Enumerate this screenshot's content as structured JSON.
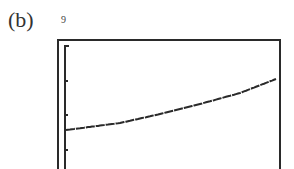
{
  "panel": {
    "label": "(b)"
  },
  "axes": {
    "ymax_label": "9"
  },
  "chart_data": {
    "type": "line",
    "title": "",
    "xlabel": "",
    "ylabel": "",
    "ylim": [
      0,
      9
    ],
    "y_tick_label_top": "9",
    "grid": false,
    "legend": null,
    "style": "graphing-calculator stepped pixel curve, increasing, slightly concave up",
    "x_pixels": [
      66,
      120,
      160,
      200,
      240,
      276
    ],
    "y_pixels": [
      130,
      123,
      114,
      104,
      93,
      79
    ],
    "approx_values": {
      "x_norm": [
        0.0,
        0.26,
        0.45,
        0.64,
        0.83,
        1.0
      ],
      "y": [
        2.7,
        3.3,
        4.1,
        4.9,
        5.9,
        7.1
      ]
    }
  },
  "colors": {
    "ink": "#2a2a2a",
    "background": "#ffffff"
  }
}
